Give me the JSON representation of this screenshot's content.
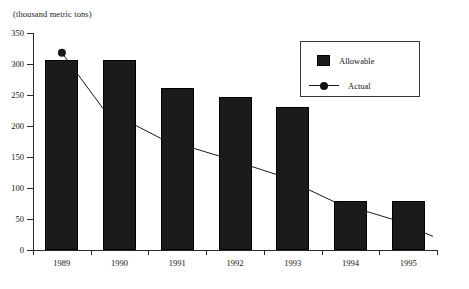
{
  "chart_data": {
    "type": "bar",
    "title": "",
    "unit_label": "(thousand metric tons)",
    "xlabel": "",
    "ylabel": "",
    "ylim": [
      0,
      350
    ],
    "yticks": [
      0,
      50,
      100,
      150,
      200,
      250,
      300,
      350
    ],
    "grid": false,
    "legend_position": "top-right",
    "categories": [
      "1989",
      "1990",
      "1991",
      "1992",
      "1993",
      "1994",
      "1995"
    ],
    "series": [
      {
        "name": "Allowable",
        "type": "bar",
        "color": "#1b1b1b",
        "values": [
          306,
          306,
          262,
          247,
          231,
          79,
          79
        ]
      },
      {
        "name": "Actual",
        "type": "line",
        "color": "#1a1a1a",
        "marker": "circle",
        "values": [
          318,
          228,
          180,
          152,
          122,
          78,
          50
        ]
      }
    ]
  },
  "legend": {
    "items": [
      {
        "label": "Allowable",
        "marker": "filled-square"
      },
      {
        "label": "Actual",
        "marker": "line-with-dot"
      }
    ]
  }
}
